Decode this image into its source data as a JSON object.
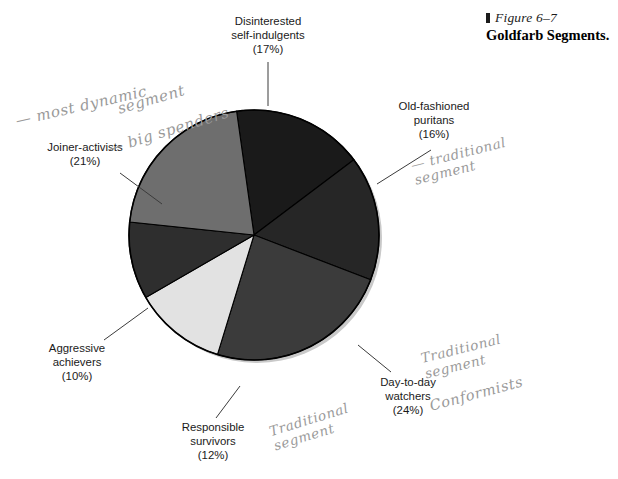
{
  "figure": {
    "number_label": "Figure 6–7",
    "title": "Goldfarb Segments."
  },
  "chart_data": {
    "type": "pie",
    "title": "Goldfarb Segments.",
    "xlabel": "",
    "ylabel": "",
    "legend": "none",
    "labels_position": "outside-with-leader-lines",
    "total_percent": 100,
    "categories": [
      "Disinterested self-indulgents",
      "Old-fashioned puritans",
      "Day-to-day watchers",
      "Responsible survivors",
      "Aggressive achievers",
      "Joiner-activists"
    ],
    "values": [
      17,
      16,
      24,
      12,
      10,
      21
    ],
    "slices": [
      {
        "name": "Disinterested self-indulgents",
        "line1": "Disinterested",
        "line2": "self-indulgents",
        "percent": 17,
        "percent_label": "(17%)",
        "color": "#1a1a1a",
        "start_angle_deg": 352,
        "end_angle_deg": 53
      },
      {
        "name": "Old-fashioned puritans",
        "line1": "Old-fashioned",
        "line2": "puritans",
        "percent": 16,
        "percent_label": "(16%)",
        "color": "#262626",
        "start_angle_deg": 53,
        "end_angle_deg": 111
      },
      {
        "name": "Day-to-day watchers",
        "line1": "Day-to-day",
        "line2": "watchers",
        "percent": 24,
        "percent_label": "(24%)",
        "color": "#3b3b3b",
        "start_angle_deg": 111,
        "end_angle_deg": 197
      },
      {
        "name": "Responsible survivors",
        "line1": "Responsible",
        "line2": "survivors",
        "percent": 12,
        "percent_label": "(12%)",
        "color": "#e2e2e2",
        "start_angle_deg": 197,
        "end_angle_deg": 240
      },
      {
        "name": "Aggressive achievers",
        "line1": "Aggressive",
        "line2": "achievers",
        "percent": 10,
        "percent_label": "(10%)",
        "color": "#2e2e2e",
        "start_angle_deg": 240,
        "end_angle_deg": 276
      },
      {
        "name": "Joiner-activists",
        "line1": "Joiner-activists",
        "line2": "",
        "percent": 21,
        "percent_label": "(21%)",
        "color": "#6e6e6e",
        "start_angle_deg": 276,
        "end_angle_deg": 352
      }
    ]
  },
  "annotations": {
    "most_dynamic": "— most dynamic",
    "segment_word": "segment",
    "big_spenders": "— big spenders",
    "traditional_segment_puritans": "— traditional\n   segment",
    "traditional_segment_responsible": "Traditional\n  segment",
    "traditional_segment_daytoday": "Traditional\n segment",
    "conformists": "Conformists"
  },
  "source_note": {
    "text": ""
  }
}
